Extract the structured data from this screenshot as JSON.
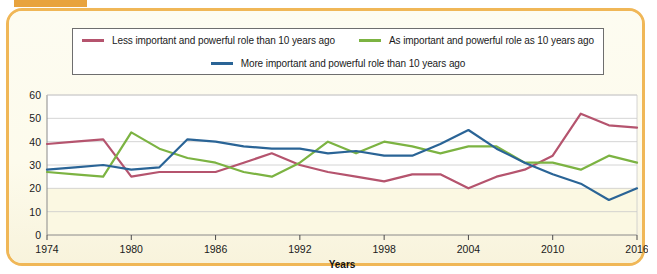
{
  "figure": {
    "frame_color": "#f0b757",
    "tab_color": "#e8a33d",
    "background": "#fdfbec"
  },
  "legend": {
    "position": "top",
    "items": [
      {
        "label": "Less important and powerful role than 10 years ago",
        "color": "#b5546e",
        "icon": "line-swatch"
      },
      {
        "label": "As important and powerful role as 10 years ago",
        "color": "#7cb342",
        "icon": "line-swatch"
      },
      {
        "label": "More important and powerful role than 10 years ago",
        "color": "#2a6496",
        "icon": "line-swatch"
      }
    ]
  },
  "axes": {
    "x_title": "Years",
    "y_ticks": [
      "0",
      "10",
      "20",
      "30",
      "40",
      "50",
      "60"
    ],
    "x_ticks": [
      "1974",
      "1980",
      "1986",
      "1992",
      "1998",
      "2004",
      "2010",
      "2016"
    ]
  },
  "chart_data": {
    "type": "line",
    "title": "",
    "xlabel": "Years",
    "ylabel": "",
    "xlim": [
      1974,
      2016
    ],
    "ylim": [
      0,
      60
    ],
    "grid": true,
    "legend_position": "top",
    "x": [
      1974,
      1976,
      1978,
      1980,
      1982,
      1984,
      1986,
      1988,
      1990,
      1992,
      1994,
      1996,
      1998,
      2000,
      2002,
      2004,
      2006,
      2008,
      2010,
      2012,
      2014,
      2016
    ],
    "series": [
      {
        "name": "Less important and powerful role than 10 years ago",
        "color": "#b5546e",
        "values": [
          39,
          40,
          41,
          25,
          27,
          27,
          27,
          31,
          35,
          30,
          27,
          25,
          23,
          26,
          26,
          20,
          25,
          28,
          34,
          52,
          47,
          46
        ]
      },
      {
        "name": "As important and powerful role as 10 years ago",
        "color": "#7cb342",
        "values": [
          27,
          26,
          25,
          44,
          37,
          33,
          31,
          27,
          25,
          31,
          40,
          35,
          40,
          38,
          35,
          38,
          38,
          31,
          31,
          28,
          34,
          31
        ]
      },
      {
        "name": "More important and powerful role than 10 years ago",
        "color": "#2a6496",
        "values": [
          28,
          29,
          30,
          28,
          29,
          41,
          40,
          38,
          37,
          37,
          35,
          36,
          34,
          34,
          39,
          45,
          37,
          31,
          26,
          22,
          15,
          20
        ]
      }
    ]
  }
}
